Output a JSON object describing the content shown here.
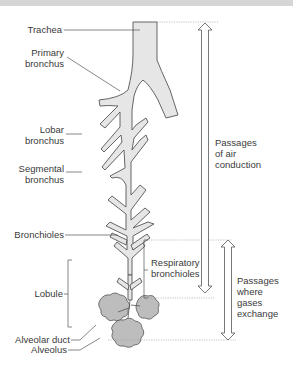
{
  "diagram": {
    "labels": {
      "trachea": "Trachea",
      "primary_bronchus": [
        "Primary",
        "bronchus"
      ],
      "lobar_bronchus": [
        "Lobar",
        "bronchus"
      ],
      "segmental_bronchus": [
        "Segmental",
        "bronchus"
      ],
      "bronchioles": "Bronchioles",
      "lobule": "Lobule",
      "alveolar_duct": "Alveolar duct",
      "alveolus": "Alveolus",
      "respiratory_bronchioles": [
        "Respiratory",
        "bronchioles"
      ],
      "air_conduction": [
        "Passages",
        "of air",
        "conduction"
      ],
      "gas_exchange": [
        "Passages",
        "where",
        "gases",
        "exchange"
      ]
    },
    "colors": {
      "airway_fill": "#e6e6e6",
      "airway_stroke": "#555555",
      "alveoli_fill": "#bdbdbd",
      "text": "#3a3a3a",
      "leader": "#555555"
    }
  }
}
